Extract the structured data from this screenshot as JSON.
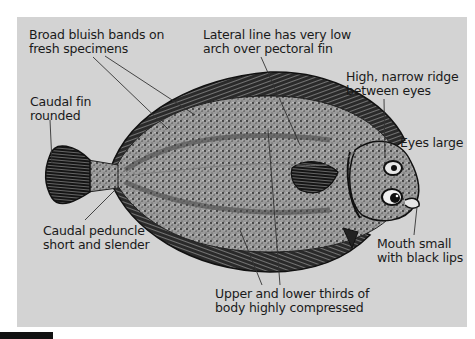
{
  "figure": {
    "background_color": "#d3d3d3",
    "labels": [
      {
        "id": "bluish-bands",
        "text": "Broad bluish bands on\nfresh specimens"
      },
      {
        "id": "lateral-line",
        "text": "Lateral line has very low\narch over pectoral fin"
      },
      {
        "id": "ridge",
        "text": "High, narrow ridge\nbetween eyes"
      },
      {
        "id": "caudal-fin",
        "text": "Caudal fin\nrounded"
      },
      {
        "id": "eyes",
        "text": "Eyes large"
      },
      {
        "id": "peduncle",
        "text": "Caudal peduncle\nshort and slender"
      },
      {
        "id": "mouth",
        "text": "Mouth small\nwith black lips"
      },
      {
        "id": "compressed",
        "text": "Upper and lower thirds of\nbody highly compressed"
      }
    ]
  }
}
